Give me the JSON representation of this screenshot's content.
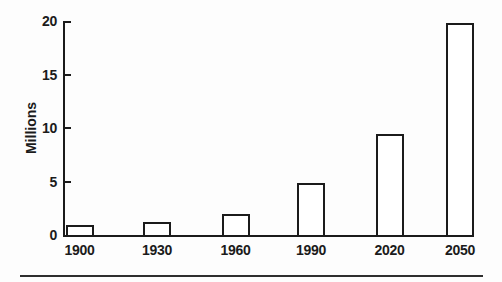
{
  "chart_data": {
    "type": "bar",
    "title": "",
    "categories": [
      "1900",
      "1930",
      "1960",
      "1990",
      "2020",
      "2050"
    ],
    "values": [
      0.9,
      1.2,
      2.0,
      4.9,
      9.4,
      19.8
    ],
    "xlabel": "",
    "ylabel": "Millions",
    "ylim": [
      0,
      20
    ],
    "yticks": [
      0,
      5,
      10,
      15,
      20
    ],
    "grid": false,
    "legend": null,
    "bar_fill": "#ffffff",
    "stroke": "#1b1b1b",
    "background": "#fdfdfd"
  },
  "figure": {
    "bottom_rule": true
  }
}
